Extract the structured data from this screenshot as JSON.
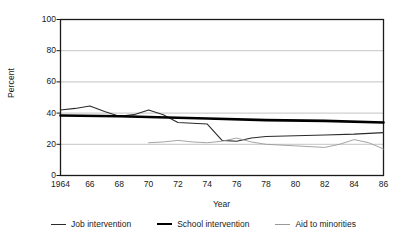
{
  "chart_data": {
    "type": "line",
    "title": "",
    "xlabel": "Year",
    "ylabel": "Percent",
    "xlim": [
      1964,
      1986
    ],
    "ylim": [
      0,
      100
    ],
    "yticks": [
      0,
      20,
      40,
      60,
      80,
      100
    ],
    "ytick_labels": [
      "0",
      "20",
      "40",
      "60",
      "80",
      "100"
    ],
    "xticks": [
      1964,
      1966,
      1968,
      1970,
      1972,
      1974,
      1976,
      1978,
      1980,
      1982,
      1984,
      1986
    ],
    "xtick_labels": [
      "1964",
      "66",
      "68",
      "70",
      "72",
      "74",
      "76",
      "78",
      "80",
      "82",
      "84",
      "86"
    ],
    "grid": "horizontal",
    "legend_position": "bottom",
    "series": [
      {
        "name": "Job intervention",
        "color": "#2b2b2b",
        "width": 1.1,
        "x": [
          1964,
          1965,
          1966,
          1967,
          1968,
          1969,
          1970,
          1971,
          1972,
          1973,
          1974,
          1975,
          1976,
          1977,
          1978,
          1980,
          1982,
          1984,
          1986
        ],
        "values": [
          42,
          43,
          44.5,
          41,
          38,
          39,
          42,
          39,
          34,
          33.5,
          33,
          22.5,
          22,
          24,
          25,
          25.5,
          26,
          26.5,
          27.5
        ]
      },
      {
        "name": "School intervention",
        "color": "#000000",
        "width": 2.6,
        "x": [
          1964,
          1968,
          1970,
          1974,
          1978,
          1982,
          1986
        ],
        "values": [
          38.5,
          38,
          37.5,
          36.5,
          35.5,
          35,
          34
        ]
      },
      {
        "name": "Aid to minorities",
        "color": "#9a9a9a",
        "width": 0.9,
        "x": [
          1970,
          1971,
          1972,
          1973,
          1974,
          1975,
          1976,
          1977,
          1978,
          1980,
          1982,
          1983,
          1984,
          1985,
          1986
        ],
        "values": [
          21,
          21.5,
          22.5,
          21.5,
          21,
          22,
          24,
          21.5,
          20,
          19,
          18,
          20,
          23,
          21,
          17
        ]
      }
    ]
  },
  "axes": {
    "ylabel": "Percent",
    "xlabel": "Year"
  },
  "legend": {
    "items": [
      {
        "label": "Job intervention",
        "style": "job"
      },
      {
        "label": "School intervention",
        "style": "school"
      },
      {
        "label": "Aid to minorities",
        "style": "aid"
      }
    ]
  }
}
